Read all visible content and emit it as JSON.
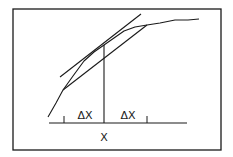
{
  "diagram": {
    "labels": {
      "delta_left": "ΔX",
      "delta_right": "ΔX",
      "x_label": "X"
    },
    "colors": {
      "line": "#1a1a1a",
      "background": "#ffffff"
    },
    "frame": {
      "x": 13,
      "y": 9,
      "width": 208,
      "height": 141
    },
    "baseline": {
      "x1": 49,
      "x2": 187,
      "y": 123
    },
    "ticks": [
      {
        "x": 64,
        "y1": 116,
        "y2": 123
      },
      {
        "x": 147,
        "y1": 116,
        "y2": 123
      }
    ],
    "vertical_at_x": {
      "x": 104,
      "y1": 45,
      "y2": 123
    },
    "curve_points": "48,117 56,103 63,90 73,76 84,61 94,52 104,45 114,38 124,31 135,27 147,25 160,23 175,20 188,20 199,19",
    "tangent_line": {
      "x1": 60,
      "y1": 77,
      "x2": 141,
      "y2": 14
    },
    "secant_line": {
      "x1": 63,
      "y1": 90,
      "x2": 147,
      "y2": 25
    },
    "label_positions": {
      "delta_left": {
        "x": 85,
        "y": 119
      },
      "delta_right": {
        "x": 128,
        "y": 119
      },
      "x_label": {
        "x": 104,
        "y": 141
      }
    }
  }
}
